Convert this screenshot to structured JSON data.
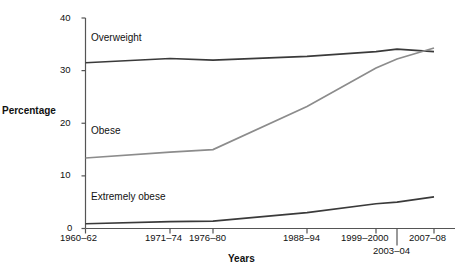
{
  "chart_data": {
    "type": "line",
    "title": "",
    "xlabel": "Years",
    "ylabel": "Percentage",
    "categories": [
      "1960–62",
      "1971–74",
      "1976–80",
      "1988–94",
      "1999–2000",
      "2003–04",
      "2007–08"
    ],
    "x_tick_labels": [
      "1960–62",
      "1971–74",
      "1976–80",
      "1988–94",
      "1999–2000",
      "2003–04",
      "2007–08"
    ],
    "y_tick_labels": [
      "0",
      "10",
      "20",
      "30",
      "40"
    ],
    "y_ticks": [
      0,
      10,
      20,
      30,
      40
    ],
    "ylim": [
      0,
      40
    ],
    "grid": false,
    "legend_position": "inline-annotations",
    "series": [
      {
        "name": "Overweight",
        "color": "#3a3a3a",
        "values": [
          31.5,
          32.3,
          32.0,
          32.7,
          33.6,
          34.1,
          33.6
        ],
        "annotation": "Overweight"
      },
      {
        "name": "Obese",
        "color": "#8c8c8c",
        "values": [
          13.4,
          14.5,
          15.0,
          23.2,
          30.5,
          32.2,
          34.3
        ],
        "annotation": "Obese"
      },
      {
        "name": "Extremely obese",
        "color": "#3a3a3a",
        "values": [
          0.9,
          1.3,
          1.4,
          3.0,
          4.7,
          5.0,
          6.0
        ],
        "annotation": "Extremely obese"
      }
    ],
    "annotations": [
      {
        "text": "Overweight",
        "series": "Overweight"
      },
      {
        "text": "Obese",
        "series": "Obese"
      },
      {
        "text": "Extremely obese",
        "series": "Extremely obese"
      }
    ]
  },
  "axes": {
    "y_label": "Percentage",
    "x_label": "Years",
    "y_ticks": [
      "40",
      "30",
      "20",
      "10",
      "0"
    ],
    "x_ticks_top_row": [
      "1960–62",
      "1971–74",
      "1976–80",
      "1988–94",
      "1999–2000",
      "2007–08"
    ],
    "x_tick_offset_row": "2003–04"
  },
  "series_labels": {
    "overweight": "Overweight",
    "obese": "Obese",
    "extremely_obese": "Extremely obese"
  },
  "colors": {
    "dark_line": "#3a3a3a",
    "gray_line": "#8c8c8c",
    "axis": "#555555",
    "text": "#111111"
  }
}
